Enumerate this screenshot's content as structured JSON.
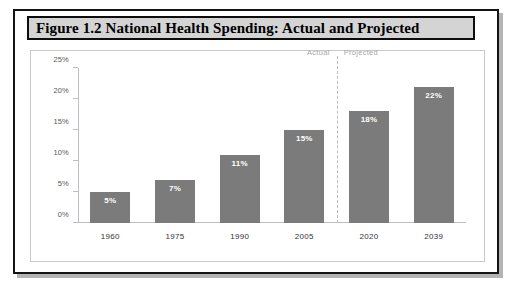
{
  "figure": {
    "title": "Figure 1.2 National Health Spending: Actual and Projected"
  },
  "chart_data": {
    "type": "bar",
    "title": "Figure 1.2 National Health Spending: Actual and Projected",
    "xlabel": "",
    "ylabel": "",
    "categories": [
      "1960",
      "1975",
      "1990",
      "2005",
      "2020",
      "2039"
    ],
    "values": [
      5,
      7,
      11,
      15,
      18,
      22
    ],
    "value_labels": [
      "5%",
      "7%",
      "11%",
      "15%",
      "18%",
      "22%"
    ],
    "ylim": [
      0,
      25
    ],
    "yticks": [
      0,
      5,
      10,
      15,
      20,
      25
    ],
    "ytick_labels": [
      "0%",
      "5%",
      "10%",
      "15%",
      "20%",
      "25%"
    ],
    "grid": false,
    "legend": "none",
    "bar_color": "#7b7b7b",
    "value_label_color": "#ffffff",
    "annotations": [
      {
        "text": "Actual",
        "position": "left-of-divider"
      },
      {
        "text": "Projected",
        "position": "right-of-divider"
      }
    ],
    "divider": {
      "after_category": "2005",
      "style": "dashed",
      "color": "#bcbcbc"
    }
  }
}
